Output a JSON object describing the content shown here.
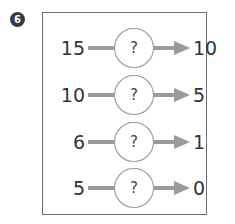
{
  "problem": {
    "number": "6",
    "rows": [
      {
        "input": "15",
        "operator": "?",
        "output": "10"
      },
      {
        "input": "10",
        "operator": "?",
        "output": "5"
      },
      {
        "input": "6",
        "operator": "?",
        "output": "1"
      },
      {
        "input": "5",
        "operator": "?",
        "output": "0"
      }
    ]
  },
  "colors": {
    "arrow": "#9a9a9a",
    "circle_border": "#a0a0a0",
    "badge": "#3a3a3a",
    "text": "#333333"
  }
}
